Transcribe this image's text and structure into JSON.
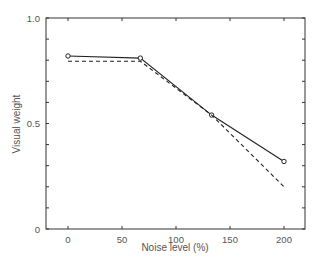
{
  "chart_data": {
    "type": "line",
    "title": "",
    "xlabel": "Noise level (%)",
    "ylabel": "Visual weight",
    "xlim": [
      -20,
      220
    ],
    "ylim": [
      0,
      1.0
    ],
    "x_ticks": [
      0,
      50,
      100,
      150,
      200
    ],
    "x_tick_labels": [
      "0",
      "50",
      "100",
      "150",
      "200"
    ],
    "y_ticks": [
      0,
      0.5,
      1.0
    ],
    "y_tick_labels": [
      "0",
      "0.5",
      "1.0"
    ],
    "y_minor_tick_step": 0.1,
    "grid": false,
    "legend": null,
    "series": [
      {
        "name": "solid",
        "style": "solid",
        "marker": "circle",
        "color": "#222222",
        "x": [
          0,
          67,
          133,
          200
        ],
        "y": [
          0.82,
          0.81,
          0.54,
          0.32
        ]
      },
      {
        "name": "dashed",
        "style": "dashed",
        "marker": "none",
        "color": "#222222",
        "x": [
          0,
          67,
          133,
          200
        ],
        "y": [
          0.795,
          0.795,
          0.54,
          0.2
        ]
      }
    ]
  }
}
